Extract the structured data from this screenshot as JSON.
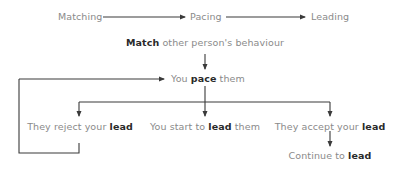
{
  "stages": [
    {
      "label": "Matching"
    },
    {
      "label": "Pacing"
    },
    {
      "label": "Leading"
    }
  ],
  "nodes": {
    "match": {
      "bold": "Match",
      "rest": " other person's behaviour"
    },
    "pace": {
      "pre": "You ",
      "bold": "pace",
      "post": " them"
    },
    "reject": {
      "pre": "They reject your ",
      "bold": "lead"
    },
    "start": {
      "pre": "You start to ",
      "bold": "lead",
      "post": " them"
    },
    "accept": {
      "pre": "They accept your ",
      "bold": "lead"
    },
    "continue": {
      "pre": "Continue to ",
      "bold": "lead"
    }
  },
  "colors": {
    "line": "#3a3a3a",
    "text": "#8a8a8a",
    "bold_text": "#2a2a2a"
  }
}
